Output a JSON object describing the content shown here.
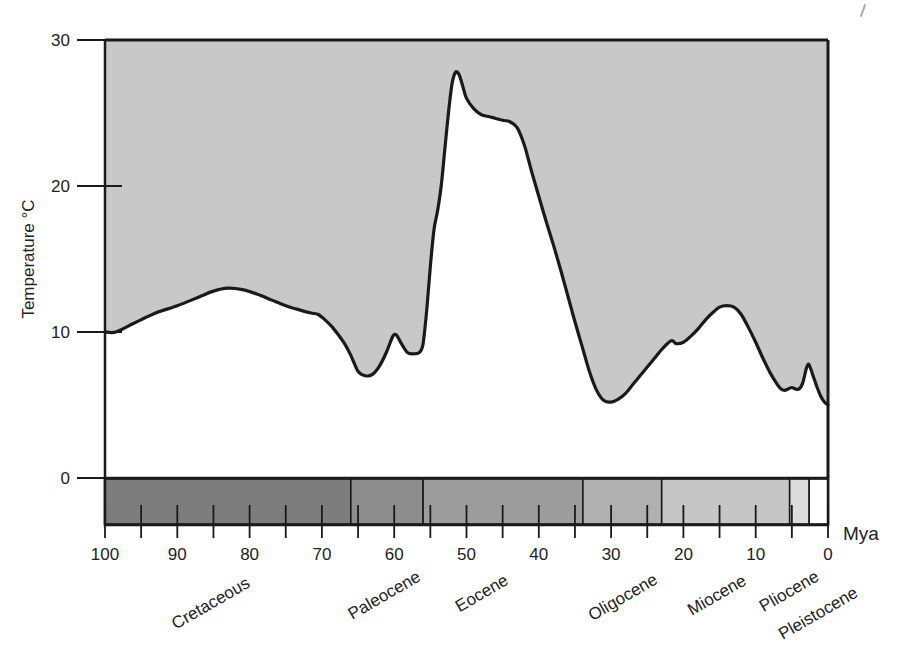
{
  "axes": {
    "y_title": "Temperature °C",
    "y_ticks": [
      {
        "value": 30,
        "label": "30"
      },
      {
        "value": 20,
        "label": "20"
      },
      {
        "value": 10,
        "label": "10"
      },
      {
        "value": 0,
        "label": "0"
      }
    ],
    "x_unit_label": "Mya",
    "x_ticks": [
      {
        "value": 100,
        "label": "100"
      },
      {
        "value": 95,
        "label": ""
      },
      {
        "value": 90,
        "label": "90"
      },
      {
        "value": 85,
        "label": ""
      },
      {
        "value": 80,
        "label": "80"
      },
      {
        "value": 75,
        "label": ""
      },
      {
        "value": 70,
        "label": "70"
      },
      {
        "value": 65,
        "label": ""
      },
      {
        "value": 60,
        "label": "60"
      },
      {
        "value": 55,
        "label": ""
      },
      {
        "value": 50,
        "label": "50"
      },
      {
        "value": 45,
        "label": ""
      },
      {
        "value": 40,
        "label": "40"
      },
      {
        "value": 35,
        "label": ""
      },
      {
        "value": 30,
        "label": "30"
      },
      {
        "value": 25,
        "label": ""
      },
      {
        "value": 20,
        "label": "20"
      },
      {
        "value": 15,
        "label": ""
      },
      {
        "value": 10,
        "label": "10"
      },
      {
        "value": 5,
        "label": ""
      },
      {
        "value": 0,
        "label": "0"
      }
    ]
  },
  "chart_data": {
    "type": "area",
    "title": "",
    "subtitle": "",
    "xlabel": "Mya",
    "ylabel": "Temperature °C",
    "xlim": [
      100,
      0
    ],
    "ylim": [
      0,
      30
    ],
    "x_reversed": true,
    "grid": false,
    "legend": "none",
    "fill_above_curve": true,
    "series": [
      {
        "name": "Global mean temperature",
        "points": [
          [
            100.0,
            10.0
          ],
          [
            98.5,
            10.0
          ],
          [
            96.0,
            10.6
          ],
          [
            93.0,
            11.3
          ],
          [
            90.0,
            11.8
          ],
          [
            87.0,
            12.4
          ],
          [
            85.0,
            12.8
          ],
          [
            83.0,
            13.0
          ],
          [
            81.0,
            12.9
          ],
          [
            79.0,
            12.6
          ],
          [
            77.0,
            12.2
          ],
          [
            75.0,
            11.8
          ],
          [
            73.0,
            11.5
          ],
          [
            71.5,
            11.3
          ],
          [
            70.5,
            11.2
          ],
          [
            69.5,
            10.8
          ],
          [
            68.5,
            10.3
          ],
          [
            67.0,
            9.3
          ],
          [
            66.0,
            8.4
          ],
          [
            65.0,
            7.3
          ],
          [
            64.0,
            7.0
          ],
          [
            63.0,
            7.1
          ],
          [
            62.0,
            7.7
          ],
          [
            61.0,
            8.7
          ],
          [
            60.2,
            9.7
          ],
          [
            59.7,
            9.8
          ],
          [
            59.0,
            9.2
          ],
          [
            58.2,
            8.6
          ],
          [
            57.5,
            8.5
          ],
          [
            56.5,
            8.6
          ],
          [
            56.0,
            9.2
          ],
          [
            55.5,
            11.5
          ],
          [
            55.0,
            14.5
          ],
          [
            54.5,
            17.0
          ],
          [
            54.0,
            18.3
          ],
          [
            53.5,
            20.0
          ],
          [
            53.0,
            22.5
          ],
          [
            52.5,
            25.0
          ],
          [
            52.0,
            27.0
          ],
          [
            51.5,
            27.8
          ],
          [
            51.0,
            27.6
          ],
          [
            50.5,
            26.8
          ],
          [
            50.0,
            26.0
          ],
          [
            49.0,
            25.3
          ],
          [
            48.0,
            24.9
          ],
          [
            46.5,
            24.7
          ],
          [
            45.0,
            24.5
          ],
          [
            44.0,
            24.4
          ],
          [
            43.0,
            24.0
          ],
          [
            42.0,
            22.8
          ],
          [
            41.0,
            21.0
          ],
          [
            40.0,
            19.3
          ],
          [
            39.0,
            17.6
          ],
          [
            38.0,
            16.0
          ],
          [
            37.0,
            14.3
          ],
          [
            36.0,
            12.5
          ],
          [
            35.0,
            10.7
          ],
          [
            34.0,
            9.0
          ],
          [
            33.0,
            7.3
          ],
          [
            32.0,
            6.0
          ],
          [
            31.0,
            5.3
          ],
          [
            30.0,
            5.2
          ],
          [
            29.0,
            5.4
          ],
          [
            28.0,
            5.8
          ],
          [
            27.0,
            6.4
          ],
          [
            26.0,
            7.0
          ],
          [
            25.0,
            7.6
          ],
          [
            24.0,
            8.2
          ],
          [
            23.0,
            8.8
          ],
          [
            22.0,
            9.3
          ],
          [
            21.5,
            9.4
          ],
          [
            21.0,
            9.2
          ],
          [
            20.0,
            9.3
          ],
          [
            19.0,
            9.7
          ],
          [
            18.0,
            10.2
          ],
          [
            17.0,
            10.8
          ],
          [
            16.0,
            11.3
          ],
          [
            15.0,
            11.7
          ],
          [
            14.0,
            11.8
          ],
          [
            13.0,
            11.7
          ],
          [
            12.0,
            11.2
          ],
          [
            11.0,
            10.3
          ],
          [
            10.0,
            9.3
          ],
          [
            9.0,
            8.2
          ],
          [
            8.0,
            7.2
          ],
          [
            7.0,
            6.4
          ],
          [
            6.5,
            6.1
          ],
          [
            6.0,
            6.0
          ],
          [
            5.5,
            6.1
          ],
          [
            5.0,
            6.2
          ],
          [
            4.5,
            6.1
          ],
          [
            4.0,
            6.1
          ],
          [
            3.5,
            6.5
          ],
          [
            3.0,
            7.5
          ],
          [
            2.7,
            7.8
          ],
          [
            2.4,
            7.5
          ],
          [
            2.0,
            6.9
          ],
          [
            1.5,
            6.2
          ],
          [
            1.0,
            5.6
          ],
          [
            0.5,
            5.2
          ],
          [
            0.0,
            5.0
          ]
        ]
      }
    ],
    "epoch_bands": [
      {
        "name": "Cretaceous",
        "start": 100.0,
        "end": 66.0,
        "color": "#7d7d7d"
      },
      {
        "name": "Paleocene",
        "start": 66.0,
        "end": 56.0,
        "color": "#8d8d8d"
      },
      {
        "name": "Eocene",
        "start": 56.0,
        "end": 33.9,
        "color": "#9d9d9d"
      },
      {
        "name": "Oligocene",
        "start": 33.9,
        "end": 23.0,
        "color": "#b0b0b0"
      },
      {
        "name": "Miocene",
        "start": 23.0,
        "end": 5.3,
        "color": "#c6c6c6"
      },
      {
        "name": "Pliocene",
        "start": 5.3,
        "end": 2.6,
        "color": "#dcdcdc"
      },
      {
        "name": "Pleistocene",
        "start": 2.6,
        "end": 0.0,
        "color": "#ffffff"
      }
    ],
    "epoch_labels": [
      {
        "name": "Cretaceous",
        "at": 85.0
      },
      {
        "name": "Paleocene",
        "at": 61.0
      },
      {
        "name": "Eocene",
        "at": 47.5
      },
      {
        "name": "Oligocene",
        "at": 28.0
      },
      {
        "name": "Miocene",
        "at": 15.0
      },
      {
        "name": "Pliocene",
        "at": 5.0
      },
      {
        "name": "Pleistocene",
        "at": 1.0
      }
    ]
  },
  "colors": {
    "fill_above": "#c8c8c8",
    "curve": "#1a1a1a",
    "axis": "#1a1a1a",
    "text": "#222222"
  }
}
